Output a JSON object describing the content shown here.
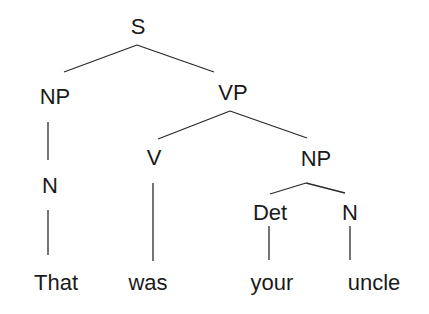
{
  "diagram": {
    "type": "syntax-tree",
    "nodes": {
      "s": "S",
      "np_subject": "NP",
      "vp": "VP",
      "n_subject": "N",
      "v": "V",
      "np_object": "NP",
      "det": "Det",
      "n_object": "N"
    },
    "words": {
      "w1": "That",
      "w2": "was",
      "w3": "your",
      "w4": "uncle"
    },
    "edges": [
      [
        "S",
        "NP"
      ],
      [
        "S",
        "VP"
      ],
      [
        "NP",
        "N"
      ],
      [
        "N",
        "That"
      ],
      [
        "VP",
        "V"
      ],
      [
        "VP",
        "NP"
      ],
      [
        "V",
        "was"
      ],
      [
        "NP",
        "Det"
      ],
      [
        "NP",
        "N"
      ],
      [
        "Det",
        "your"
      ],
      [
        "N",
        "uncle"
      ]
    ],
    "colors": {
      "ink": "#1a1a1a",
      "background": "#ffffff"
    }
  }
}
